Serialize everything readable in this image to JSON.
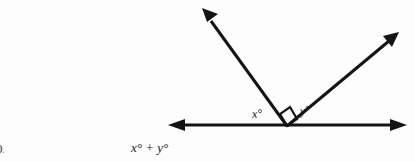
{
  "page": {
    "background_color": "#fdfdfd",
    "ink_color": "#141414",
    "width": 415,
    "height": 162
  },
  "figure": {
    "name": "perpendicular-rays-on-line",
    "vertex": {
      "x": 287,
      "y": 126
    },
    "baseline": {
      "label": "horizontal-line",
      "left_end": {
        "x": 168,
        "y": 125
      },
      "right_end": {
        "x": 407,
        "y": 125
      },
      "arrowheads": "both"
    },
    "rays": [
      {
        "name": "upper-left-ray",
        "from": {
          "x": 287,
          "y": 126
        },
        "to": {
          "x": 202,
          "y": 8
        },
        "angle_from_positive_x_axis_deg": 125,
        "arrowhead": "end"
      },
      {
        "name": "upper-right-ray",
        "from": {
          "x": 287,
          "y": 126
        },
        "to": {
          "x": 399,
          "y": 32
        },
        "angle_from_positive_x_axis_deg": 40,
        "arrowhead": "end"
      }
    ],
    "right_angle_marker": {
      "present": true,
      "description": "square marking 90 degrees between the two rays",
      "size": 11
    },
    "angle_labels": {
      "left": "x°",
      "right": "y°"
    }
  },
  "caption": {
    "expression": "x° + y°",
    "item_marker": "0."
  }
}
